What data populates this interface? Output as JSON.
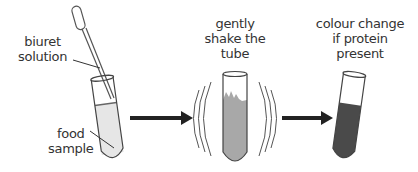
{
  "diagram": {
    "steps": [
      {
        "id": "step-1",
        "labels": {
          "reagent": [
            "biuret",
            "solution"
          ],
          "sample": [
            "food",
            "sample"
          ]
        }
      },
      {
        "id": "step-2",
        "labels": {
          "action": [
            "gently",
            "shake the",
            "tube"
          ]
        }
      },
      {
        "id": "step-3",
        "labels": {
          "result": [
            "colour change",
            "if protein",
            "present"
          ]
        }
      }
    ],
    "colors": {
      "sample_liquid": "#e6e6e6",
      "shaken_liquid": "#a8a8a8",
      "result_liquid": "#4a4a4a",
      "arrow": "#222222",
      "outline": "#444444"
    }
  }
}
